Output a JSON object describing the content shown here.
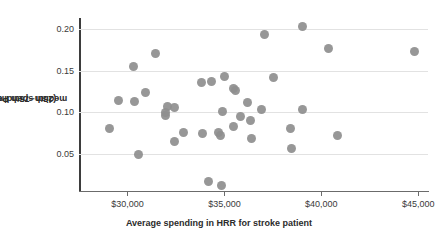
{
  "chart_data": {
    "type": "scatter",
    "title": "",
    "xlabel": "Average spending in HRR for stroke patient",
    "ylabel": "(25th−75th Percentile)/ median spending",
    "ylabel_line1": "(25th−75th Percentile)/",
    "ylabel_line2": "median spending",
    "xlim": [
      27500,
      45500
    ],
    "ylim": [
      0.005,
      0.212
    ],
    "grid": true,
    "gridlines_y": [
      0.05,
      0.1,
      0.15,
      0.2
    ],
    "legend": "none",
    "marker_color": "#8e8e8e",
    "axis_color": "#3d3d3d",
    "grid_color": "#e2e2e2",
    "xticks": [
      30000,
      35000,
      40000,
      45000
    ],
    "xtick_labels": [
      "$30,000",
      "$35,000",
      "$40,000",
      "$45,000"
    ],
    "yticks": [
      0.05,
      0.1,
      0.15,
      0.2
    ],
    "ytick_labels": [
      "0.05",
      "0.10",
      "0.15",
      "0.20"
    ],
    "points": [
      {
        "x": 29050,
        "y": 0.08
      },
      {
        "x": 29550,
        "y": 0.114
      },
      {
        "x": 30300,
        "y": 0.155
      },
      {
        "x": 30350,
        "y": 0.113
      },
      {
        "x": 30550,
        "y": 0.049
      },
      {
        "x": 30950,
        "y": 0.123
      },
      {
        "x": 31450,
        "y": 0.171
      },
      {
        "x": 31950,
        "y": 0.1
      },
      {
        "x": 31980,
        "y": 0.096
      },
      {
        "x": 32050,
        "y": 0.107
      },
      {
        "x": 32400,
        "y": 0.106
      },
      {
        "x": 32450,
        "y": 0.064
      },
      {
        "x": 32900,
        "y": 0.075
      },
      {
        "x": 33800,
        "y": 0.136
      },
      {
        "x": 33850,
        "y": 0.074
      },
      {
        "x": 34350,
        "y": 0.137
      },
      {
        "x": 34700,
        "y": 0.075
      },
      {
        "x": 34780,
        "y": 0.072
      },
      {
        "x": 34900,
        "y": 0.101
      },
      {
        "x": 35000,
        "y": 0.143
      },
      {
        "x": 34200,
        "y": 0.016
      },
      {
        "x": 34850,
        "y": 0.012
      },
      {
        "x": 35450,
        "y": 0.128
      },
      {
        "x": 35550,
        "y": 0.126
      },
      {
        "x": 35450,
        "y": 0.083
      },
      {
        "x": 35850,
        "y": 0.095
      },
      {
        "x": 36200,
        "y": 0.112
      },
      {
        "x": 36350,
        "y": 0.09
      },
      {
        "x": 36400,
        "y": 0.068
      },
      {
        "x": 36900,
        "y": 0.103
      },
      {
        "x": 37050,
        "y": 0.193
      },
      {
        "x": 37550,
        "y": 0.141
      },
      {
        "x": 38400,
        "y": 0.08
      },
      {
        "x": 38450,
        "y": 0.056
      },
      {
        "x": 39050,
        "y": 0.203
      },
      {
        "x": 39050,
        "y": 0.103
      },
      {
        "x": 40350,
        "y": 0.177
      },
      {
        "x": 40850,
        "y": 0.072
      },
      {
        "x": 44800,
        "y": 0.173
      }
    ]
  }
}
